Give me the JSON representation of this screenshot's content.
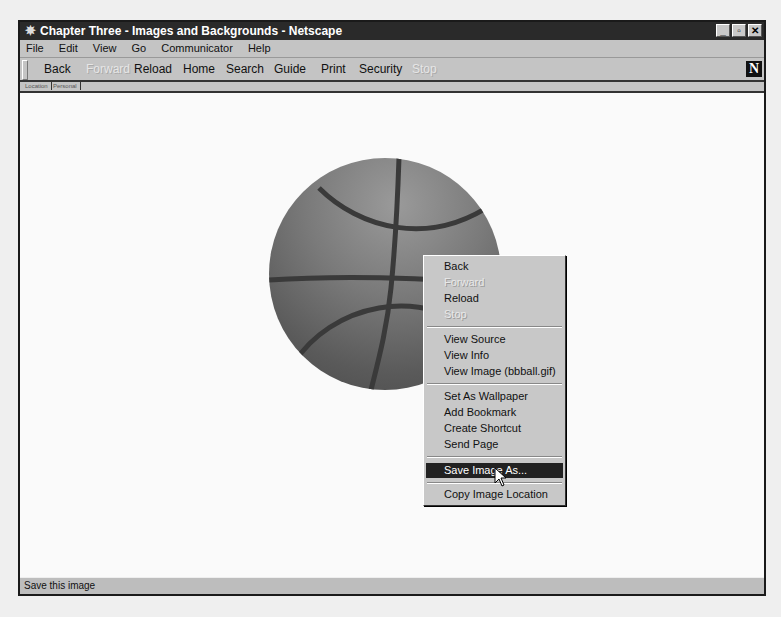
{
  "window": {
    "title": "Chapter Three - Images and Backgrounds - Netscape",
    "controls": {
      "minimize": "_",
      "restore": "▫",
      "close": "✕"
    }
  },
  "menubar": {
    "items": [
      "File",
      "Edit",
      "View",
      "Go",
      "Communicator",
      "Help"
    ]
  },
  "toolbar": {
    "buttons": [
      {
        "label": "Back",
        "enabled": true
      },
      {
        "label": "Forward",
        "enabled": false
      },
      {
        "label": "Reload",
        "enabled": true
      },
      {
        "label": "Home",
        "enabled": true
      },
      {
        "label": "Search",
        "enabled": true
      },
      {
        "label": "Guide",
        "enabled": true
      },
      {
        "label": "Print",
        "enabled": true
      },
      {
        "label": "Security",
        "enabled": true
      },
      {
        "label": "Stop",
        "enabled": false
      }
    ],
    "logo": "N"
  },
  "personal_tabs": [
    "Location",
    "Personal"
  ],
  "content": {
    "image_file": "bbball.gif"
  },
  "context_menu": {
    "items": [
      {
        "label": "Back",
        "enabled": true
      },
      {
        "label": "Forward",
        "enabled": false
      },
      {
        "label": "Reload",
        "enabled": true
      },
      {
        "label": "Stop",
        "enabled": false
      },
      {
        "label": "View Source",
        "enabled": true
      },
      {
        "label": "View Info",
        "enabled": true
      },
      {
        "label": "View Image (bbball.gif)",
        "enabled": true
      },
      {
        "label": "Set As Wallpaper",
        "enabled": true
      },
      {
        "label": "Add Bookmark",
        "enabled": true
      },
      {
        "label": "Create Shortcut",
        "enabled": true
      },
      {
        "label": "Send Page",
        "enabled": true
      },
      {
        "label": "Save Image As...",
        "enabled": true,
        "selected": true
      },
      {
        "label": "Copy Image Location",
        "enabled": true
      }
    ]
  },
  "statusbar": {
    "text": "Save this image"
  }
}
